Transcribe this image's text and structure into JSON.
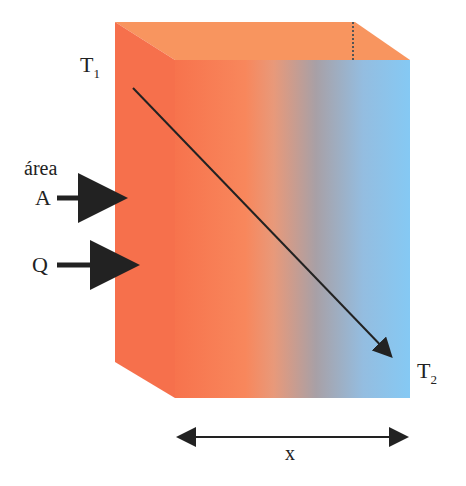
{
  "diagram": {
    "labels": {
      "t1": "T",
      "t1_sub": "1",
      "t2": "T",
      "t2_sub": "2",
      "area": "área",
      "a": "A",
      "q": "Q",
      "x": "x"
    },
    "colors": {
      "hot": "#f6704c",
      "hot_top": "#f8955f",
      "mid": "#a49a9c",
      "cold": "#86c8f2",
      "arrow": "#222222"
    }
  }
}
